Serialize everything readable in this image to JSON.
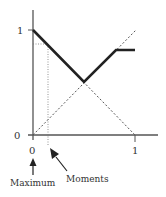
{
  "diagram": {
    "y_axis": {
      "tick_top": "1",
      "tick_bottom": "0"
    },
    "x_axis": {
      "tick_left": "0",
      "tick_right": "1"
    },
    "annotations": {
      "maximum_label": "Maximum",
      "moments_label": "Moments"
    },
    "colors": {
      "axis": "#555555",
      "thick_line": "#222222",
      "dashed_line": "#555555"
    }
  }
}
